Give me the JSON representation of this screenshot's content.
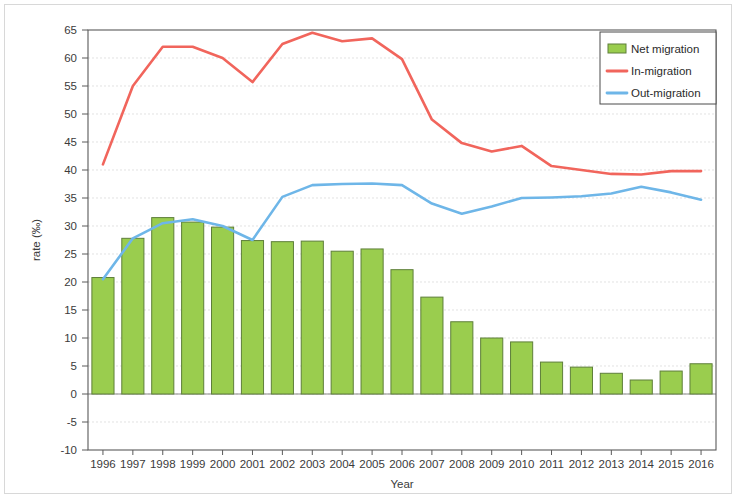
{
  "chart_data": {
    "type": "bar",
    "title": "",
    "xlabel": "Year",
    "ylabel": "rate (‰)",
    "grid": true,
    "legend_position": "top-right",
    "xlim": [
      1996,
      2016
    ],
    "ylim": [
      -10,
      65
    ],
    "ytick_step": 5,
    "categories": [
      "1996",
      "1997",
      "1998",
      "1999",
      "2000",
      "2001",
      "2002",
      "2003",
      "2004",
      "2005",
      "2006",
      "2007",
      "2008",
      "2009",
      "2010",
      "2011",
      "2012",
      "2013",
      "2014",
      "2015",
      "2016"
    ],
    "ytick_labels": [
      "65",
      "60",
      "55",
      "50",
      "45",
      "40",
      "35",
      "30",
      "25",
      "20",
      "15",
      "10",
      "5",
      "0",
      "-5",
      "-10"
    ],
    "series": [
      {
        "name": "Net migration",
        "kind": "bar",
        "color": "#9ACD4E",
        "edge_color": "#5E7F3A",
        "values": [
          20.8,
          27.8,
          31.5,
          30.7,
          29.8,
          27.4,
          27.2,
          27.3,
          25.5,
          25.9,
          22.2,
          17.3,
          12.9,
          10.0,
          9.3,
          5.7,
          4.8,
          3.7,
          2.5,
          4.1,
          5.4
        ]
      },
      {
        "name": "In-migration",
        "kind": "line",
        "color": "#F1655C",
        "values": [
          41.0,
          55.0,
          62.0,
          62.0,
          60.0,
          55.7,
          62.5,
          64.5,
          63.0,
          63.5,
          59.8,
          49.0,
          44.8,
          43.3,
          44.3,
          40.7,
          40.0,
          39.3,
          39.2,
          39.8,
          39.8
        ]
      },
      {
        "name": "Out-migration",
        "kind": "line",
        "color": "#6EB6E8",
        "values": [
          20.5,
          27.8,
          30.5,
          31.2,
          30.0,
          27.5,
          35.2,
          37.3,
          37.5,
          37.6,
          37.3,
          34.0,
          32.2,
          33.5,
          35.0,
          35.1,
          35.3,
          35.8,
          37.0,
          36.0,
          34.7
        ]
      }
    ],
    "legend_entries": [
      {
        "label": "Net migration",
        "marker": "swatch",
        "color": "#9ACD4E"
      },
      {
        "label": "In-migration",
        "marker": "line",
        "color": "#F1655C"
      },
      {
        "label": "Out-migration",
        "marker": "line",
        "color": "#6EB6E8"
      }
    ]
  }
}
